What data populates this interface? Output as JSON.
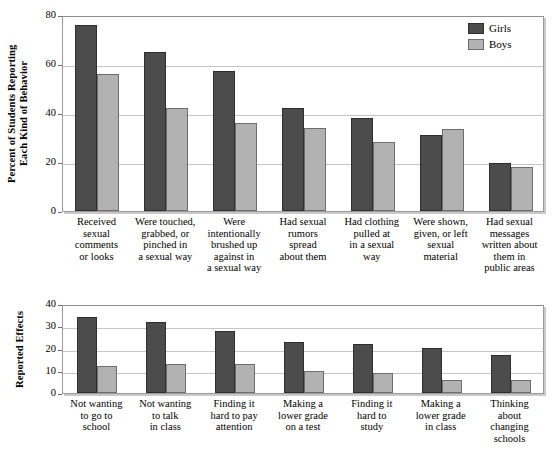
{
  "chart_data": [
    {
      "type": "bar",
      "title": "",
      "xlabel": "",
      "ylabel": "Percent of Students Reporting\nEach Kind of Behavior",
      "ylim": [
        0,
        80
      ],
      "yticks": [
        0,
        20,
        40,
        60,
        80
      ],
      "grid": true,
      "legend_position": "top-right",
      "categories": [
        "Received\nsexual\ncomments\nor looks",
        "Were touched,\ngrabbed, or\npinched in\na sexual way",
        "Were\nintentionally\nbrushed up\nagainst in\na sexual way",
        "Had sexual\nrumors\nspread\nabout them",
        "Had clothing\npulled at\nin a sexual\nway",
        "Were shown,\ngiven, or left\nsexual\nmaterial",
        "Had sexual\nmessages\nwritten about\nthem in\npublic areas"
      ],
      "series": [
        {
          "name": "Girls",
          "color": "#4c4c4c",
          "values": [
            76,
            65,
            57,
            42,
            38,
            31,
            19.5
          ]
        },
        {
          "name": "Boys",
          "color": "#b2b2b2",
          "values": [
            56,
            42,
            36,
            34,
            28,
            33.5,
            18
          ]
        }
      ]
    },
    {
      "type": "bar",
      "title": "",
      "xlabel": "",
      "ylabel": "Reported Effects",
      "ylim": [
        0,
        40
      ],
      "yticks": [
        0,
        10,
        20,
        30,
        40
      ],
      "grid": true,
      "legend_position": "none",
      "categories": [
        "Not wanting\nto go to\nschool",
        "Not wanting\nto talk\nin class",
        "Finding it\nhard to pay\nattention",
        "Making a\nlower grade\non a test",
        "Finding it\nhard to\nstudy",
        "Making a\nlower grade\nin class",
        "Thinking\nabout\nchanging\nschools"
      ],
      "series": [
        {
          "name": "Girls",
          "color": "#4c4c4c",
          "values": [
            34,
            32,
            28,
            23,
            22,
            20,
            17
          ]
        },
        {
          "name": "Boys",
          "color": "#b2b2b2",
          "values": [
            12,
            13,
            13,
            10,
            9,
            6,
            6
          ]
        }
      ]
    }
  ],
  "legend": {
    "items": [
      {
        "label": "Girls",
        "swatch": "girls"
      },
      {
        "label": "Boys",
        "swatch": "boys"
      }
    ]
  }
}
